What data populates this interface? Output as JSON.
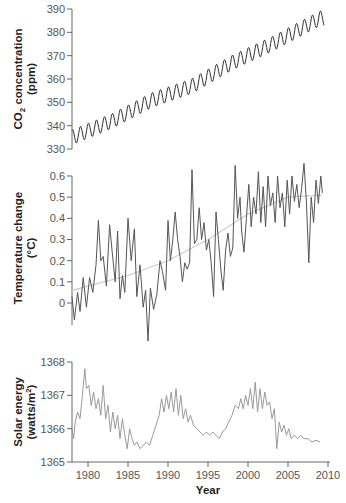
{
  "chart_data": [
    {
      "type": "line",
      "title": "",
      "ylabel": "CO2 concentration (ppm)",
      "ylabel_line1": "CO₂ concentration",
      "ylabel_line2": "(ppm)",
      "xlim": [
        1978,
        2009.5
      ],
      "ylim": [
        330,
        390
      ],
      "yticks": [
        330,
        340,
        350,
        360,
        370,
        380,
        390
      ],
      "grid": false,
      "series": [
        {
          "name": "CO2 monthly",
          "color": "#333333",
          "trend": [
            [
              1978,
              335
            ],
            [
              1983,
              342
            ],
            [
              1988,
              351
            ],
            [
              1993,
              357
            ],
            [
              1998,
              367
            ],
            [
              2003,
              375
            ],
            [
              2009,
              386
            ]
          ],
          "seasonal_amplitude": 3.2
        }
      ]
    },
    {
      "type": "line",
      "title": "",
      "ylabel": "Temperature change (°C)",
      "ylabel_line1": "Temperature change",
      "ylabel_line2": "(°C)",
      "xlim": [
        1978,
        2009.5
      ],
      "ylim": [
        -0.2,
        0.65
      ],
      "yticks": [
        0,
        0.1,
        0.2,
        0.3,
        0.4,
        0.5,
        0.6
      ],
      "grid": false,
      "series": [
        {
          "name": "Monthly temperature anomaly",
          "color": "#555555",
          "points": [
            [
              1978.0,
              0.03
            ],
            [
              1978.3,
              -0.08
            ],
            [
              1978.7,
              0.05
            ],
            [
              1979.0,
              -0.04
            ],
            [
              1979.4,
              0.12
            ],
            [
              1979.8,
              -0.02
            ],
            [
              1980.2,
              0.12
            ],
            [
              1980.6,
              0.05
            ],
            [
              1981.0,
              0.18
            ],
            [
              1981.3,
              0.39
            ],
            [
              1981.6,
              0.2
            ],
            [
              1981.9,
              0.22
            ],
            [
              1982.3,
              0.08
            ],
            [
              1982.7,
              0.37
            ],
            [
              1983.0,
              0.25
            ],
            [
              1983.4,
              0.1
            ],
            [
              1983.7,
              0.34
            ],
            [
              1984.0,
              0.02
            ],
            [
              1984.3,
              0.13
            ],
            [
              1984.6,
              0.05
            ],
            [
              1985.0,
              0.4
            ],
            [
              1985.4,
              0.2
            ],
            [
              1985.8,
              0.35
            ],
            [
              1986.1,
              0.03
            ],
            [
              1986.5,
              0.18
            ],
            [
              1986.9,
              -0.02
            ],
            [
              1987.2,
              0.06
            ],
            [
              1987.5,
              -0.18
            ],
            [
              1987.8,
              0.07
            ],
            [
              1988.2,
              -0.03
            ],
            [
              1988.6,
              0.04
            ],
            [
              1989.0,
              0.2
            ],
            [
              1989.3,
              0.15
            ],
            [
              1989.7,
              0.06
            ],
            [
              1990.0,
              0.39
            ],
            [
              1990.3,
              0.2
            ],
            [
              1990.6,
              0.3
            ],
            [
              1990.9,
              0.43
            ],
            [
              1991.2,
              0.3
            ],
            [
              1991.5,
              0.22
            ],
            [
              1991.8,
              0.1
            ],
            [
              1992.1,
              0.19
            ],
            [
              1992.4,
              0.16
            ],
            [
              1992.7,
              0.19
            ],
            [
              1993.0,
              0.63
            ],
            [
              1993.3,
              0.28
            ],
            [
              1993.6,
              0.3
            ],
            [
              1993.9,
              0.45
            ],
            [
              1994.2,
              0.3
            ],
            [
              1994.5,
              0.38
            ],
            [
              1994.8,
              0.25
            ],
            [
              1995.1,
              0.3
            ],
            [
              1995.4,
              0.19
            ],
            [
              1995.7,
              0.03
            ],
            [
              1996.0,
              0.43
            ],
            [
              1996.3,
              0.3
            ],
            [
              1996.6,
              0.16
            ],
            [
              1996.9,
              0.06
            ],
            [
              1997.2,
              0.25
            ],
            [
              1997.5,
              0.33
            ],
            [
              1997.8,
              0.22
            ],
            [
              1998.1,
              0.26
            ],
            [
              1998.4,
              0.65
            ],
            [
              1998.7,
              0.4
            ],
            [
              1999.0,
              0.5
            ],
            [
              1999.2,
              0.34
            ],
            [
              1999.5,
              0.24
            ],
            [
              1999.8,
              0.4
            ],
            [
              2000.1,
              0.56
            ],
            [
              2000.4,
              0.36
            ],
            [
              2000.7,
              0.5
            ],
            [
              2001.0,
              0.42
            ],
            [
              2001.3,
              0.62
            ],
            [
              2001.6,
              0.38
            ],
            [
              2001.9,
              0.55
            ],
            [
              2002.2,
              0.36
            ],
            [
              2002.5,
              0.6
            ],
            [
              2002.8,
              0.46
            ],
            [
              2003.1,
              0.52
            ],
            [
              2003.4,
              0.38
            ],
            [
              2003.7,
              0.6
            ],
            [
              2004.0,
              0.45
            ],
            [
              2004.3,
              0.52
            ],
            [
              2004.6,
              0.36
            ],
            [
              2004.9,
              0.58
            ],
            [
              2005.2,
              0.42
            ],
            [
              2005.5,
              0.6
            ],
            [
              2005.8,
              0.48
            ],
            [
              2006.1,
              0.56
            ],
            [
              2006.4,
              0.45
            ],
            [
              2006.7,
              0.54
            ],
            [
              2007.0,
              0.66
            ],
            [
              2007.3,
              0.48
            ],
            [
              2007.6,
              0.19
            ],
            [
              2007.9,
              0.5
            ],
            [
              2008.2,
              0.38
            ],
            [
              2008.5,
              0.58
            ],
            [
              2008.8,
              0.47
            ],
            [
              2009.1,
              0.6
            ],
            [
              2009.3,
              0.52
            ]
          ]
        },
        {
          "name": "Trend",
          "color": "#c8c8c8",
          "points": [
            [
              1978.0,
              0.06
            ],
            [
              1985.0,
              0.13
            ],
            [
              1990.0,
              0.2
            ],
            [
              1995.0,
              0.3
            ],
            [
              2000.0,
              0.42
            ],
            [
              2005.0,
              0.5
            ],
            [
              2009.3,
              0.51
            ]
          ]
        }
      ]
    },
    {
      "type": "line",
      "title": "",
      "xlabel": "Year",
      "ylabel": "Solar energy (watts/m²)",
      "ylabel_line1": "Solar energy",
      "ylabel_line2": "(watts/m²)",
      "xlim": [
        1978,
        2009.5
      ],
      "ylim": [
        1365,
        1368
      ],
      "yticks": [
        1365,
        1366,
        1367,
        1368
      ],
      "xticks": [
        1980,
        1985,
        1990,
        1995,
        2000,
        2005,
        2010
      ],
      "grid": false,
      "series": [
        {
          "name": "Total solar irradiance",
          "color": "#9a9a9a",
          "points": [
            [
              1978.0,
              1366.0
            ],
            [
              1978.2,
              1365.7
            ],
            [
              1978.4,
              1366.2
            ],
            [
              1978.7,
              1366.5
            ],
            [
              1979.0,
              1366.3
            ],
            [
              1979.3,
              1367.0
            ],
            [
              1979.6,
              1367.8
            ],
            [
              1979.8,
              1367.2
            ],
            [
              1980.1,
              1367.3
            ],
            [
              1980.4,
              1366.7
            ],
            [
              1980.7,
              1367.1
            ],
            [
              1981.0,
              1366.6
            ],
            [
              1981.3,
              1366.9
            ],
            [
              1981.6,
              1366.4
            ],
            [
              1981.9,
              1367.3
            ],
            [
              1982.2,
              1366.3
            ],
            [
              1982.5,
              1366.7
            ],
            [
              1982.8,
              1365.9
            ],
            [
              1983.1,
              1366.5
            ],
            [
              1983.4,
              1366.0
            ],
            [
              1983.7,
              1366.4
            ],
            [
              1984.0,
              1365.7
            ],
            [
              1984.3,
              1366.3
            ],
            [
              1984.6,
              1365.8
            ],
            [
              1984.9,
              1365.4
            ],
            [
              1985.2,
              1366.0
            ],
            [
              1985.5,
              1365.7
            ],
            [
              1985.8,
              1365.5
            ],
            [
              1986.1,
              1365.6
            ],
            [
              1986.5,
              1365.4
            ],
            [
              1986.9,
              1365.5
            ],
            [
              1987.3,
              1365.6
            ],
            [
              1987.7,
              1365.5
            ],
            [
              1988.1,
              1365.8
            ],
            [
              1988.5,
              1366.1
            ],
            [
              1988.9,
              1366.4
            ],
            [
              1989.2,
              1366.9
            ],
            [
              1989.5,
              1366.5
            ],
            [
              1989.8,
              1367.0
            ],
            [
              1990.1,
              1366.6
            ],
            [
              1990.4,
              1367.1
            ],
            [
              1990.7,
              1366.5
            ],
            [
              1991.0,
              1367.2
            ],
            [
              1991.3,
              1366.4
            ],
            [
              1991.6,
              1367.0
            ],
            [
              1991.9,
              1366.3
            ],
            [
              1992.2,
              1366.6
            ],
            [
              1992.5,
              1366.2
            ],
            [
              1992.8,
              1366.4
            ],
            [
              1993.2,
              1366.1
            ],
            [
              1993.6,
              1366.0
            ],
            [
              1994.0,
              1365.9
            ],
            [
              1994.4,
              1365.8
            ],
            [
              1994.8,
              1365.9
            ],
            [
              1995.2,
              1365.8
            ],
            [
              1995.6,
              1365.9
            ],
            [
              1996.0,
              1365.8
            ],
            [
              1996.4,
              1365.7
            ],
            [
              1996.8,
              1365.9
            ],
            [
              1997.2,
              1366.0
            ],
            [
              1997.6,
              1366.2
            ],
            [
              1998.0,
              1366.4
            ],
            [
              1998.4,
              1366.7
            ],
            [
              1998.8,
              1366.6
            ],
            [
              1999.1,
              1366.9
            ],
            [
              1999.4,
              1366.6
            ],
            [
              1999.7,
              1367.0
            ],
            [
              2000.0,
              1366.7
            ],
            [
              2000.3,
              1367.2
            ],
            [
              2000.6,
              1366.6
            ],
            [
              2000.9,
              1367.4
            ],
            [
              2001.2,
              1366.5
            ],
            [
              2001.5,
              1367.2
            ],
            [
              2001.8,
              1366.6
            ],
            [
              2002.1,
              1367.1
            ],
            [
              2002.4,
              1366.7
            ],
            [
              2002.7,
              1366.8
            ],
            [
              2003.0,
              1366.3
            ],
            [
              2003.3,
              1366.6
            ],
            [
              2003.6,
              1365.4
            ],
            [
              2003.9,
              1366.2
            ],
            [
              2004.2,
              1365.9
            ],
            [
              2004.5,
              1366.1
            ],
            [
              2004.8,
              1365.8
            ],
            [
              2005.1,
              1366.0
            ],
            [
              2005.4,
              1365.7
            ],
            [
              2005.8,
              1365.8
            ],
            [
              2006.2,
              1365.7
            ],
            [
              2006.6,
              1365.8
            ],
            [
              2007.0,
              1365.7
            ],
            [
              2007.5,
              1365.7
            ],
            [
              2008.0,
              1365.6
            ],
            [
              2008.5,
              1365.65
            ],
            [
              2009.0,
              1365.6
            ]
          ]
        }
      ]
    }
  ],
  "labels": {
    "co2_ylabel_a": "CO",
    "co2_ylabel_sub": "2",
    "co2_ylabel_b": " concentration",
    "co2_ylabel_c": "(ppm)",
    "temp_ylabel_a": "Temperature change",
    "temp_ylabel_b": "(°C)",
    "solar_ylabel_a": "Solar energy",
    "solar_ylabel_b": "(watts/m",
    "solar_ylabel_sup": "2",
    "solar_ylabel_c": ")",
    "xlabel": "Year",
    "co2_ticks": [
      "330",
      "340",
      "350",
      "360",
      "370",
      "380",
      "390"
    ],
    "temp_ticks": [
      "0",
      "0.1",
      "0.2",
      "0.3",
      "0.4",
      "0.5",
      "0.6"
    ],
    "solar_ticks": [
      "1365",
      "1366",
      "1367",
      "1368"
    ],
    "x_ticks": [
      "1980",
      "1985",
      "1990",
      "1995",
      "2000",
      "2005",
      "2010"
    ]
  }
}
